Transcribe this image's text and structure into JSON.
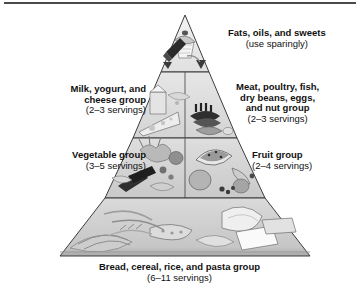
{
  "figure": {
    "name": "food-guide-pyramid",
    "top_rule_color": "#4a4a4a"
  },
  "pyramid": {
    "apex_label": "pyramid-apex",
    "outline_color": "#3d3d3d",
    "tiers": [
      {
        "id": "fats",
        "name": "fats-oils-sweets-tier",
        "fill": "#e9e9e9",
        "foods": [
          "butter",
          "cupcake",
          "candy"
        ]
      },
      {
        "id": "milk-meat",
        "name": "milk-meat-tier",
        "fill": "#dcdcdc",
        "left_foods": [
          "cheese wedge",
          "milk",
          "yogurt"
        ],
        "right_foods": [
          "steak",
          "fish",
          "eggs",
          "beans",
          "nuts"
        ]
      },
      {
        "id": "vegetable-fruit",
        "name": "vegetable-fruit-tier",
        "fill": "#d2d2d2",
        "left_foods": [
          "broccoli",
          "carrots",
          "tomato",
          "corn",
          "peppers"
        ],
        "right_foods": [
          "watermelon",
          "orange",
          "banana",
          "grapes",
          "berries"
        ]
      },
      {
        "id": "bread",
        "name": "bread-cereal-rice-pasta-tier",
        "fill": "#cfcfcf",
        "foods": [
          "bread loaf",
          "cereal",
          "rice",
          "pasta",
          "crackers"
        ]
      }
    ]
  },
  "labels": {
    "fats": {
      "title": "Fats, oils, and sweets",
      "servings": "(use sparingly)"
    },
    "milk": {
      "title_line1": "Milk, yogurt, and",
      "title_line2": "cheese group",
      "servings": "(2–3 servings)"
    },
    "meat": {
      "title_line1": "Meat, poultry, fish,",
      "title_line2": "dry beans, eggs,",
      "title_line3": "and nut group",
      "servings": "(2–3 servings)"
    },
    "vegetable": {
      "title": "Vegetable group",
      "servings": "(3–5 servings)"
    },
    "fruit": {
      "title": "Fruit group",
      "servings": "(2–4 servings)"
    },
    "bread": {
      "title": "Bread, cereal, rice, and pasta group",
      "servings": "(6–11 servings)"
    }
  }
}
